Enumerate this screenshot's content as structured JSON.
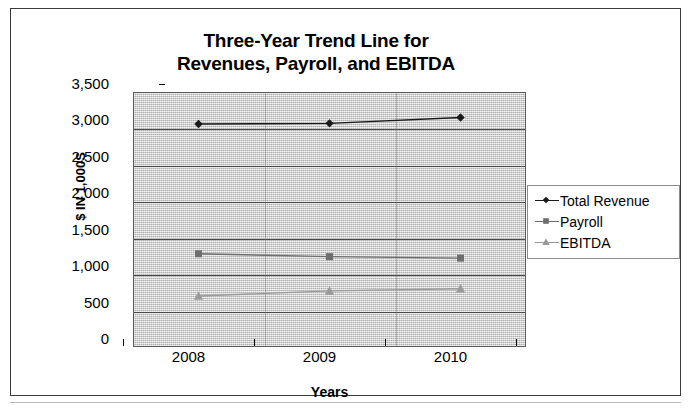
{
  "chart_data": {
    "type": "line",
    "title": "Three-Year Trend Line for Revenues, Payroll, and EBITDA",
    "title_lines": [
      "Three-Year Trend Line for",
      "Revenues, Payroll, and EBITDA"
    ],
    "xlabel": "Years",
    "ylabel": "$ IN 1,000S",
    "categories": [
      "2008",
      "2009",
      "2010"
    ],
    "ylim": [
      0,
      3500
    ],
    "ytick_values": [
      0,
      500,
      1000,
      1500,
      2000,
      2500,
      3000,
      3500
    ],
    "ytick_labels": [
      "0",
      "500",
      "1,000",
      "1,500",
      "2,000",
      "2,500",
      "3,000",
      "3,500"
    ],
    "grid": true,
    "legend_position": "right",
    "series": [
      {
        "name": "Total Revenue",
        "values": [
          3060,
          3070,
          3150
        ],
        "color": "#1a1a1a",
        "marker": "diamond"
      },
      {
        "name": "Payroll",
        "values": [
          1280,
          1240,
          1220
        ],
        "color": "#6e6e6e",
        "marker": "square"
      },
      {
        "name": "EBITDA",
        "values": [
          700,
          770,
          800
        ],
        "color": "#9a9a9a",
        "marker": "triangle"
      }
    ]
  },
  "legend": {
    "items": [
      {
        "label": "Total Revenue"
      },
      {
        "label": "Payroll"
      },
      {
        "label": "EBITDA"
      }
    ]
  },
  "caption": {
    "text": ""
  }
}
